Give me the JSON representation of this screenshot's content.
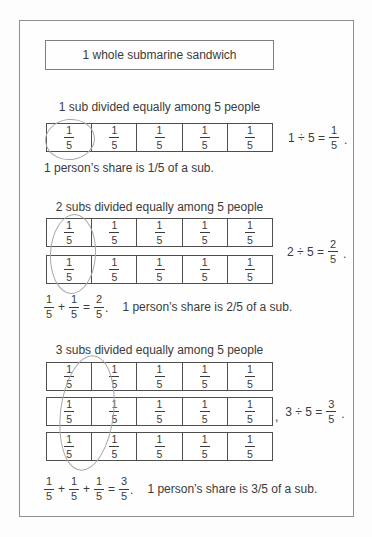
{
  "page": {
    "title": "1 whole submarine sandwich"
  },
  "cell_fraction": {
    "num": "1",
    "den": "5"
  },
  "sections": {
    "one": {
      "heading": "1 sub divided equally among 5 people",
      "division": {
        "lhs": "1 ÷ 5 =",
        "num": "1",
        "den": "5",
        "period": "."
      },
      "share_text": "1 person’s share is 1/5 of a sub."
    },
    "two": {
      "heading": "2 subs divided equally among 5 people",
      "division": {
        "lhs": "2 ÷ 5 =",
        "num": "2",
        "den": "5",
        "period": "."
      },
      "sum": {
        "plus": "+",
        "equals": "=",
        "num": "2",
        "den": "5",
        "period": "."
      },
      "share_text": "1 person’s share is 2/5 of a sub."
    },
    "three": {
      "heading": "3 subs divided equally among 5 people",
      "pre_comma": ",",
      "division": {
        "lhs": "3 ÷ 5 =",
        "num": "3",
        "den": "5",
        "period": "."
      },
      "sum": {
        "plus": "+",
        "equals": "=",
        "num": "3",
        "den": "5",
        "period": "."
      },
      "share_text": "1 person’s share is 3/5 of a sub."
    }
  }
}
